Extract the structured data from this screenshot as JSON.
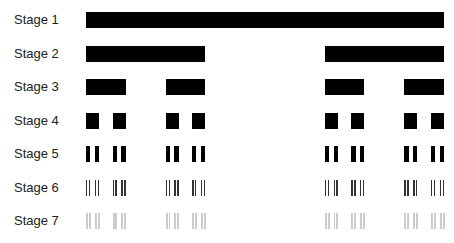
{
  "diagram": {
    "title": "",
    "type": "cantor-set-construction",
    "x_start": 86,
    "x_end": 444,
    "row_top_first": 12,
    "row_spacing": 33.5,
    "bar_height": 16,
    "stages": [
      {
        "label": "Stage 1",
        "color": "#000000"
      },
      {
        "label": "Stage 2",
        "color": "#000000"
      },
      {
        "label": "Stage 3",
        "color": "#000000"
      },
      {
        "label": "Stage 4",
        "color": "#000000"
      },
      {
        "label": "Stage 5",
        "color": "#000000"
      },
      {
        "label": "Stage 6",
        "color": "#333333"
      },
      {
        "label": "Stage 7",
        "color": "#cccccc"
      }
    ]
  }
}
